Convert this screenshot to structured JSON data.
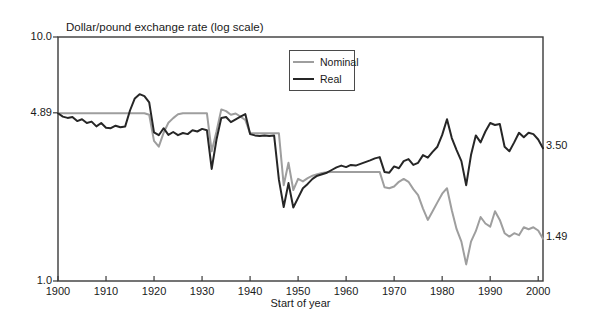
{
  "chart_data": {
    "type": "line",
    "title": "Dollar/pound exchange rate (log scale)",
    "xlabel": "Start of year",
    "scale": "log",
    "ylim": [
      1.0,
      10.0
    ],
    "x_range": [
      1900,
      2001
    ],
    "grid": false,
    "legend_position": "top-right-inside",
    "yticks": [
      {
        "value": 10.0,
        "label": "10.0"
      },
      {
        "value": 4.89,
        "label": "4.89"
      },
      {
        "value": 1.0,
        "label": "1.0"
      }
    ],
    "xticks": [
      1900,
      1910,
      1920,
      1930,
      1940,
      1950,
      1960,
      1970,
      1980,
      1990,
      2000
    ],
    "end_labels": [
      {
        "text": "3.50",
        "series": "Real",
        "value": 3.5
      },
      {
        "text": "1.49",
        "series": "Nominal",
        "value": 1.49
      }
    ],
    "frame_color": "#3a3a3a",
    "text_color": "#1a1a1a",
    "years": [
      1900,
      1901,
      1902,
      1903,
      1904,
      1905,
      1906,
      1907,
      1908,
      1909,
      1910,
      1911,
      1912,
      1913,
      1914,
      1915,
      1916,
      1917,
      1918,
      1919,
      1920,
      1921,
      1922,
      1923,
      1924,
      1925,
      1926,
      1927,
      1928,
      1929,
      1930,
      1931,
      1932,
      1933,
      1934,
      1935,
      1936,
      1937,
      1938,
      1939,
      1940,
      1941,
      1942,
      1943,
      1944,
      1945,
      1946,
      1947,
      1948,
      1949,
      1950,
      1951,
      1952,
      1953,
      1954,
      1955,
      1956,
      1957,
      1958,
      1959,
      1960,
      1961,
      1962,
      1963,
      1964,
      1965,
      1966,
      1967,
      1968,
      1969,
      1970,
      1971,
      1972,
      1973,
      1974,
      1975,
      1976,
      1977,
      1978,
      1979,
      1980,
      1981,
      1982,
      1983,
      1984,
      1985,
      1986,
      1987,
      1988,
      1989,
      1990,
      1991,
      1992,
      1993,
      1994,
      1995,
      1996,
      1997,
      1998,
      1999,
      2000,
      2001
    ],
    "series": [
      {
        "name": "Nominal",
        "color": "#9e9e9e",
        "values": [
          4.87,
          4.87,
          4.87,
          4.87,
          4.87,
          4.87,
          4.87,
          4.87,
          4.87,
          4.87,
          4.87,
          4.87,
          4.87,
          4.87,
          4.87,
          4.87,
          4.87,
          4.87,
          4.87,
          4.8,
          3.75,
          3.55,
          4.05,
          4.45,
          4.65,
          4.82,
          4.87,
          4.87,
          4.87,
          4.87,
          4.87,
          4.87,
          3.4,
          4.1,
          5.05,
          4.97,
          4.8,
          4.86,
          4.72,
          4.57,
          4.03,
          4.03,
          4.03,
          4.03,
          4.03,
          4.03,
          4.03,
          2.47,
          3.05,
          2.36,
          2.62,
          2.56,
          2.64,
          2.7,
          2.74,
          2.77,
          2.79,
          2.8,
          2.8,
          2.8,
          2.8,
          2.8,
          2.8,
          2.8,
          2.8,
          2.8,
          2.8,
          2.8,
          2.42,
          2.4,
          2.44,
          2.55,
          2.62,
          2.55,
          2.38,
          2.25,
          1.98,
          1.78,
          1.93,
          2.1,
          2.28,
          2.4,
          1.95,
          1.63,
          1.45,
          1.17,
          1.45,
          1.6,
          1.83,
          1.72,
          1.67,
          1.93,
          1.78,
          1.57,
          1.52,
          1.57,
          1.54,
          1.66,
          1.63,
          1.66,
          1.61,
          1.49
        ]
      },
      {
        "name": "Real",
        "color": "#262626",
        "values": [
          4.87,
          4.72,
          4.66,
          4.7,
          4.52,
          4.6,
          4.44,
          4.5,
          4.3,
          4.44,
          4.25,
          4.23,
          4.33,
          4.27,
          4.3,
          5.0,
          5.6,
          5.83,
          5.72,
          5.4,
          4.07,
          3.96,
          4.23,
          3.97,
          4.08,
          3.96,
          4.04,
          4.0,
          4.15,
          4.1,
          4.2,
          4.15,
          2.88,
          3.8,
          4.66,
          4.7,
          4.48,
          4.6,
          4.72,
          4.83,
          4.0,
          3.95,
          3.93,
          3.95,
          3.93,
          3.95,
          2.6,
          2.01,
          2.52,
          2.0,
          2.19,
          2.4,
          2.5,
          2.62,
          2.7,
          2.74,
          2.78,
          2.85,
          2.92,
          2.97,
          2.93,
          2.99,
          2.97,
          3.02,
          3.07,
          3.12,
          3.18,
          3.22,
          2.8,
          2.78,
          2.95,
          2.9,
          3.1,
          3.16,
          2.99,
          3.05,
          3.28,
          3.2,
          3.38,
          3.55,
          3.97,
          4.6,
          3.85,
          3.44,
          3.1,
          2.47,
          3.28,
          3.95,
          3.7,
          4.1,
          4.44,
          4.36,
          4.4,
          3.55,
          3.4,
          3.7,
          4.05,
          3.88,
          4.05,
          4.0,
          3.8,
          3.5
        ]
      }
    ]
  }
}
